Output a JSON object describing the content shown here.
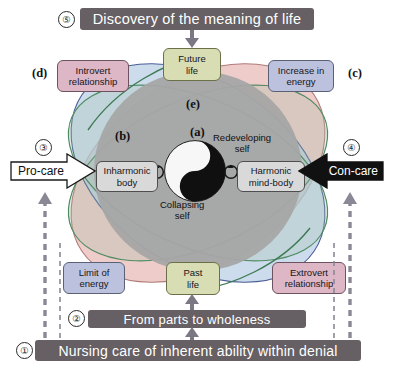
{
  "diagram": {
    "title_banner": "Discovery of the meaning of life",
    "mid_banner": "From parts to wholeness",
    "bottom_banner": "Nursing care of inherent ability within denial"
  },
  "steps": {
    "one": "①",
    "two": "②",
    "three": "③",
    "four": "④",
    "five": "⑤"
  },
  "letters": {
    "a": "(a)",
    "b": "(b)",
    "c": "(c)",
    "d": "(d)",
    "e": "(e)"
  },
  "nodes": {
    "introvert": {
      "line1": "Introvert",
      "line2": "relationship",
      "color": "#ddb7c6"
    },
    "increase": {
      "line1": "Increase in",
      "line2": "energy",
      "color": "#bcc2de"
    },
    "future": {
      "line1": "Future",
      "line2": "life",
      "color": "#d8ddb4"
    },
    "past": {
      "line1": "Past",
      "line2": "life",
      "color": "#d8ddb4"
    },
    "limit": {
      "line1": "Limit of",
      "line2": "energy",
      "color": "#bcc2de"
    },
    "extrovert": {
      "line1": "Extrovert",
      "line2": "relationship",
      "color": "#ddb7c6"
    },
    "inharmonic": {
      "line1": "Inharmonic",
      "line2": "body",
      "color": "#d9d9d9"
    },
    "harmonic": {
      "line1": "Harmonic",
      "line2": "mind-body",
      "color": "#d9d9d9"
    }
  },
  "captions": {
    "redeveloping": {
      "line1": "Redeveloping",
      "line2": "self"
    },
    "collapsing": {
      "line1": "Collapsing",
      "line2": "self"
    }
  },
  "care": {
    "pro_label": "Pro-care",
    "con_label": "Con-care"
  },
  "colors": {
    "banner": "#665f63",
    "center_circle": "#a6a6a6",
    "petal_pink": "#e8b9b4",
    "petal_blue": "#b9cfe4",
    "petal_green_outline": "#4f8c63",
    "petal_blue_outline": "#4a5e96",
    "arrow_dashed": "#8a8894",
    "yin": "#ffffff",
    "yang": "#101010"
  },
  "icons": {
    "loop_left": "circular-arrow-icon",
    "loop_right": "circular-arrow-icon",
    "down_arrow": "arrow-down-icon",
    "up_arrow": "arrow-up-icon"
  }
}
